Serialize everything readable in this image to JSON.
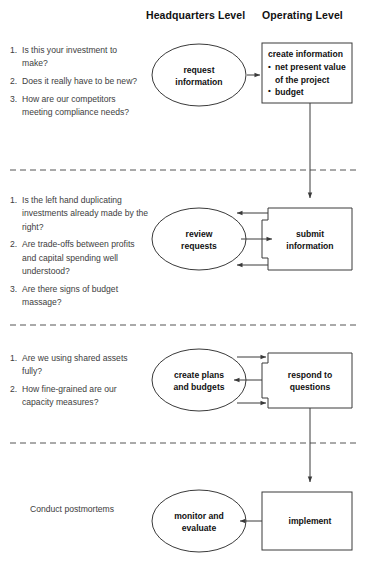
{
  "headers": {
    "hq": "Headquarters Level",
    "operating": "Operating Level"
  },
  "sections": [
    {
      "id": "request",
      "questions": [
        {
          "num": "1.",
          "text": "Is this your investment to make?"
        },
        {
          "num": "2.",
          "text": "Does it really have to be new?"
        },
        {
          "num": "3.",
          "text": "How are our competitors meeting compliance needs?"
        }
      ],
      "ellipse_label": "request\ninformation",
      "box_title": "create information",
      "box_bullets": [
        "net present value of the project",
        "budget"
      ]
    },
    {
      "id": "review",
      "questions": [
        {
          "num": "1.",
          "text": "Is the left hand duplicating investments already made by the right?"
        },
        {
          "num": "2.",
          "text": "Are trade-offs between profits and capital spending well understood?"
        },
        {
          "num": "3.",
          "text": "Are there signs of budget massage?"
        }
      ],
      "ellipse_label": "review\nrequests",
      "box_title": "submit\ninformation",
      "box_bullets": []
    },
    {
      "id": "plans",
      "questions": [
        {
          "num": "1.",
          "text": "Are we using shared assets fully?"
        },
        {
          "num": "2.",
          "text": "How fine-grained are our capacity measures?"
        }
      ],
      "ellipse_label": "create plans\nand budgets",
      "box_title": "respond to\nquestions",
      "box_bullets": []
    },
    {
      "id": "monitor",
      "note": "Conduct postmortems",
      "questions": [],
      "ellipse_label": "monitor and\nevaluate",
      "box_title": "implement",
      "box_bullets": []
    }
  ],
  "colors": {
    "stroke": "#3a3a3a",
    "divider": "#555555",
    "text": "#1a1a1a",
    "question_text": "#3d3d3d",
    "background": "#ffffff"
  }
}
